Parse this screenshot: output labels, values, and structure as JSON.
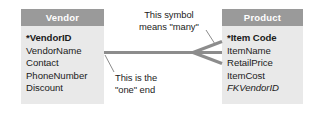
{
  "diagram": {
    "type": "entity-relationship-diagram",
    "notation": "crow's foot",
    "relationship": "one-to-many",
    "colors": {
      "header_fill": "#9a9a9a",
      "header_text": "#ffffff",
      "body_fill": "#e9e9e9",
      "field_text": "#1b1b1b",
      "connector": "#8c8c8c",
      "leader": "#8c8c8c",
      "background": "#ffffff"
    },
    "entities": [
      {
        "id": "vendor",
        "title": "Vendor",
        "side": "left",
        "cardinality": "one",
        "fields": [
          {
            "label": "*VendorID",
            "style": "key"
          },
          {
            "label": "VendorName",
            "style": "normal"
          },
          {
            "label": "Contact",
            "style": "normal"
          },
          {
            "label": "PhoneNumber",
            "style": "normal"
          },
          {
            "label": "Discount",
            "style": "normal"
          }
        ]
      },
      {
        "id": "product",
        "title": "Product",
        "side": "right",
        "cardinality": "many",
        "fields": [
          {
            "label": "*Item Code",
            "style": "key"
          },
          {
            "label": "ItemName",
            "style": "normal"
          },
          {
            "label": "RetailPrice",
            "style": "normal"
          },
          {
            "label": "ItemCost",
            "style": "normal"
          },
          {
            "label": "FKVendorID",
            "style": "fk"
          }
        ]
      }
    ],
    "annotations": [
      {
        "id": "many",
        "lines": [
          "This symbol",
          "means \"many\""
        ],
        "points_to": "crows-foot-symbol"
      },
      {
        "id": "one",
        "lines": [
          "This is the",
          "\"one\" end"
        ],
        "points_to": "vendor-connector-end"
      }
    ]
  }
}
